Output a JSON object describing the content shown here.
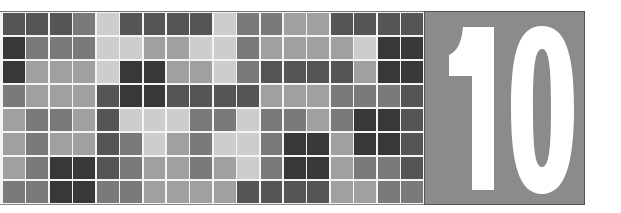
{
  "graphic": {
    "type": "chapter-opener",
    "chapter_number": "10",
    "panel_color": "#8b8b8b",
    "number_color": "#ffffff"
  },
  "mosaic": {
    "rows": 8,
    "columns": 18,
    "palette": {
      "D": "#383838",
      "d": "#555555",
      "m": "#7a7a7a",
      "l": "#a0a0a0",
      "L": "#cdcdcd"
    },
    "grid": [
      [
        "d",
        "d",
        "d",
        "m",
        "L",
        "d",
        "d",
        "d",
        "d",
        "L",
        "m",
        "m",
        "l",
        "l",
        "d",
        "d",
        "d",
        "d"
      ],
      [
        "D",
        "m",
        "m",
        "m",
        "L",
        "L",
        "l",
        "l",
        "L",
        "L",
        "m",
        "l",
        "l",
        "l",
        "l",
        "L",
        "D",
        "D"
      ],
      [
        "D",
        "l",
        "l",
        "l",
        "L",
        "D",
        "D",
        "l",
        "l",
        "L",
        "m",
        "d",
        "d",
        "d",
        "d",
        "l",
        "D",
        "D"
      ],
      [
        "m",
        "l",
        "l",
        "l",
        "d",
        "D",
        "D",
        "d",
        "d",
        "d",
        "d",
        "l",
        "l",
        "l",
        "m",
        "m",
        "m",
        "d"
      ],
      [
        "l",
        "m",
        "m",
        "l",
        "d",
        "L",
        "L",
        "L",
        "m",
        "m",
        "L",
        "m",
        "m",
        "l",
        "m",
        "D",
        "D",
        "d"
      ],
      [
        "l",
        "m",
        "l",
        "l",
        "d",
        "m",
        "L",
        "l",
        "m",
        "L",
        "L",
        "m",
        "D",
        "D",
        "l",
        "D",
        "D",
        "d"
      ],
      [
        "l",
        "m",
        "D",
        "D",
        "d",
        "m",
        "l",
        "l",
        "m",
        "l",
        "L",
        "m",
        "D",
        "D",
        "l",
        "m",
        "m",
        "d"
      ],
      [
        "m",
        "m",
        "D",
        "D",
        "m",
        "m",
        "l",
        "l",
        "l",
        "l",
        "d",
        "d",
        "d",
        "d",
        "l",
        "l",
        "m",
        "m"
      ]
    ]
  }
}
